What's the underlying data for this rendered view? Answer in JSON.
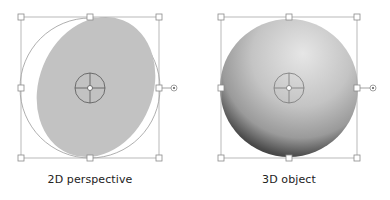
{
  "panels": [
    {
      "id": "2d",
      "caption": "2D perspective",
      "shape": "flat-ellipse",
      "fill_color": "#c2c2c2"
    },
    {
      "id": "3d",
      "caption": "3D object",
      "shape": "shaded-sphere",
      "fill_color": "#bdbdbd"
    }
  ],
  "icons": {
    "center_reticle": "crosshair-target-icon",
    "rotation_handle": "rotate-handle-icon",
    "resize_handle": "square-handle-icon"
  },
  "colors": {
    "selection_line": "#a8a8a8",
    "handle_fill": "#ffffff",
    "reticle_line": "#555555"
  }
}
